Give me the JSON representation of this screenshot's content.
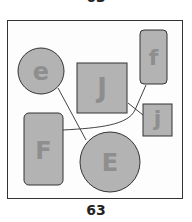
{
  "header": {
    "page_number_partial": "63"
  },
  "footer": {
    "page_number": "63"
  },
  "diagram": {
    "fill_color": "#b3b3b3",
    "stroke_color": "#333333",
    "label_color": "#8e8e8e",
    "nodes": [
      {
        "id": "e",
        "label": "e",
        "shape": "circle"
      },
      {
        "id": "J",
        "label": "J",
        "shape": "square"
      },
      {
        "id": "f",
        "label": "f",
        "shape": "rounded-rect"
      },
      {
        "id": "j",
        "label": "j",
        "shape": "square"
      },
      {
        "id": "F",
        "label": "F",
        "shape": "rounded-rect"
      },
      {
        "id": "E",
        "label": "E",
        "shape": "circle"
      }
    ],
    "edges": [
      {
        "from": "e",
        "to": "E"
      },
      {
        "from": "F",
        "to": "f"
      },
      {
        "from": "J",
        "to": "j"
      }
    ]
  }
}
